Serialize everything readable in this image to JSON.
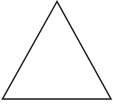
{
  "diagram": {
    "shape": "triangle",
    "type": "equilateral-triangle-outline",
    "stroke_color": "#1a1a1a",
    "fill_color": "#ffffff",
    "background": "#ffffff",
    "vertices": {
      "apex": [
        57,
        1.5
      ],
      "bottom_left": [
        2.5,
        99
      ],
      "bottom_right": [
        111,
        99
      ]
    }
  }
}
